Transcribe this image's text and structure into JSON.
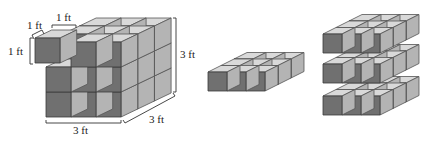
{
  "figure": {
    "colors": {
      "front_face": "#707070",
      "top_face": "#d9d9d9",
      "side_face": "#b4b4b4",
      "edge": "#3a3a3a",
      "background": "#ffffff"
    },
    "unit_cube_labels": {
      "depth": "1 ft",
      "width": "1 ft",
      "height": "1 ft"
    },
    "big_cube_labels": {
      "height": "3 ft",
      "width": "3 ft",
      "depth": "3 ft"
    },
    "panels": [
      {
        "name": "cube",
        "rows": 3,
        "cols": 3,
        "layers": 3
      },
      {
        "name": "single-layer",
        "rows": 1,
        "cols": 3,
        "layers": 3
      },
      {
        "name": "stacked-layers",
        "rows": 3,
        "cols": 3,
        "layers": 3
      }
    ]
  }
}
